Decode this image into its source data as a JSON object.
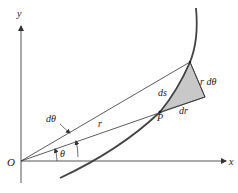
{
  "diagram": {
    "title": "",
    "axes": {
      "x_label": "x",
      "y_label": "y",
      "origin_label": "O"
    },
    "labels": {
      "d_theta": "dθ",
      "r": "r",
      "theta": "θ",
      "ds": "ds",
      "P": "P",
      "dr": "dr",
      "r_d_theta": "r dθ"
    },
    "colors": {
      "line": "#333333",
      "curve": "#444444",
      "shade": "#c8c8c8",
      "background": "#ffffff"
    }
  }
}
